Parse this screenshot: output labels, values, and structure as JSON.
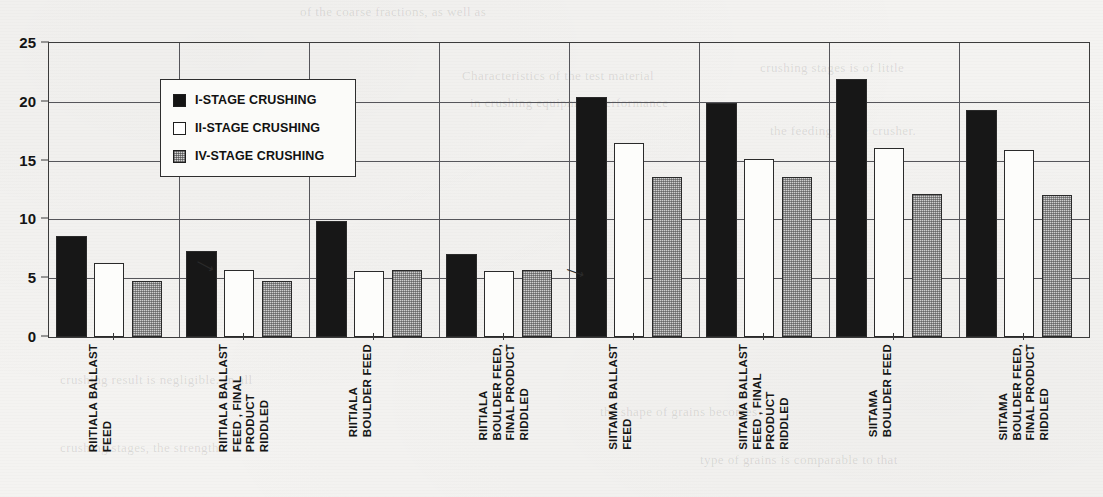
{
  "chart_data": {
    "type": "bar",
    "title": "",
    "xlabel": "",
    "ylabel": "",
    "ylim": [
      0,
      25
    ],
    "yticks": [
      0,
      5,
      10,
      15,
      20,
      25
    ],
    "grid": true,
    "legend_position": "upper-left-inside",
    "categories": [
      "RIITIALA BALLAST\nFEED",
      "RIITIALA BALLAST\nFEED , FINAL\nPRODUCT\nRIDDLED",
      "RIITIALA\nBOULDER FEED",
      "RIITIALA\nBOULDER FEED,\nFINAL PRODUCT\nRIDDLED",
      "SIITAMA BALLAST\nFEED",
      "SIITAMA BALLAST\nFEED , FINAL\nPRODUCT\nRIDDLED",
      "SIITAMA\nBOULDER FEED",
      "SIITAMA\nBOULDER FEED,\nFINAL PRODUCT\nRIDDLED"
    ],
    "series": [
      {
        "name": "I-STAGE CRUSHING",
        "values": [
          8.6,
          7.3,
          9.9,
          7.1,
          20.4,
          19.9,
          21.9,
          19.3
        ]
      },
      {
        "name": "II-STAGE CRUSHING",
        "values": [
          6.3,
          5.7,
          5.6,
          5.6,
          16.5,
          15.1,
          16.1,
          15.9
        ]
      },
      {
        "name": "IV-STAGE CRUSHING",
        "values": [
          4.8,
          4.8,
          5.7,
          5.7,
          13.6,
          13.6,
          12.2,
          12.1
        ]
      }
    ],
    "colors": {
      "series_1": "#171717",
      "series_2": "#fdfdfb",
      "series_3": "#cfcfcf",
      "axis": "#3b3b3b",
      "grid": "#55555a"
    }
  },
  "legend": {
    "items": [
      {
        "label": "I-STAGE CRUSHING"
      },
      {
        "label": "II-STAGE CRUSHING"
      },
      {
        "label": "IV-STAGE CRUSHING"
      }
    ]
  },
  "yaxis": {
    "ticks": [
      "25",
      "20",
      "15",
      "10",
      "5",
      "0"
    ]
  },
  "background_text": {
    "lines": [
      "of the coarse fractions, as well as",
      "Characteristics of the test material",
      "in crushing equipment performance",
      "crushing stages is of little",
      "the feeding of the crusher.",
      "crushing result is negligible. In all",
      "the shape of grains becomes",
      "crushing stages, the strength",
      "type of grains is comparable to that"
    ]
  }
}
